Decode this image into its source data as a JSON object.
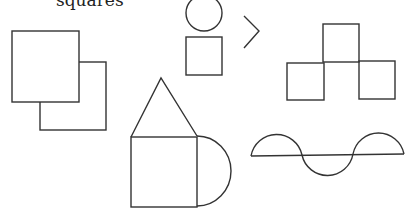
{
  "caption": "squares",
  "figures": [
    {
      "name": "overlapping-squares"
    },
    {
      "name": "circle-over-square"
    },
    {
      "name": "greater-than-arrow"
    },
    {
      "name": "three-squares-t"
    },
    {
      "name": "house-with-semicircle"
    },
    {
      "name": "wave-on-line"
    }
  ],
  "stroke_color": "#333333"
}
